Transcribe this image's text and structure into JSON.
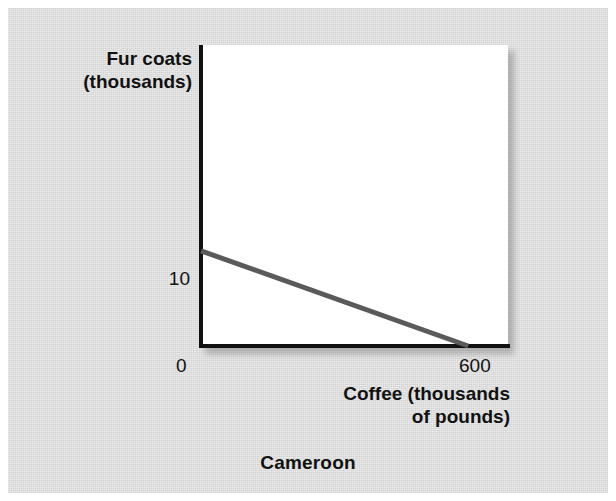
{
  "caption": "Cameroon",
  "axes": {
    "y_title": "Fur coats\n(thousands)",
    "x_title": "Coffee (thousands\nof pounds)",
    "y_tick_10": "10",
    "x_tick_0": "0",
    "x_tick_600": "600"
  },
  "colors": {
    "background": "#ffffff",
    "panel": "#d9d9d9",
    "plot_area": "#ffffff",
    "axis": "#111111",
    "curve": "#5a5a5a",
    "text": "#111111"
  },
  "chart_data": {
    "type": "line",
    "title": "",
    "subtitle": "Cameroon",
    "xlabel": "Coffee (thousands of pounds)",
    "ylabel": "Fur coats (thousands)",
    "xlim": [
      0,
      660
    ],
    "ylim": [
      0,
      31
    ],
    "xticks": [
      0,
      600
    ],
    "xticklabels": [
      "0",
      "600"
    ],
    "yticks": [
      10
    ],
    "yticklabels": [
      "10"
    ],
    "grid": false,
    "legend": null,
    "series": [
      {
        "name": "Production possibilities frontier",
        "color": "#5a5a5a",
        "x": [
          0,
          600
        ],
        "values": [
          10,
          0
        ]
      }
    ],
    "annotations": []
  }
}
